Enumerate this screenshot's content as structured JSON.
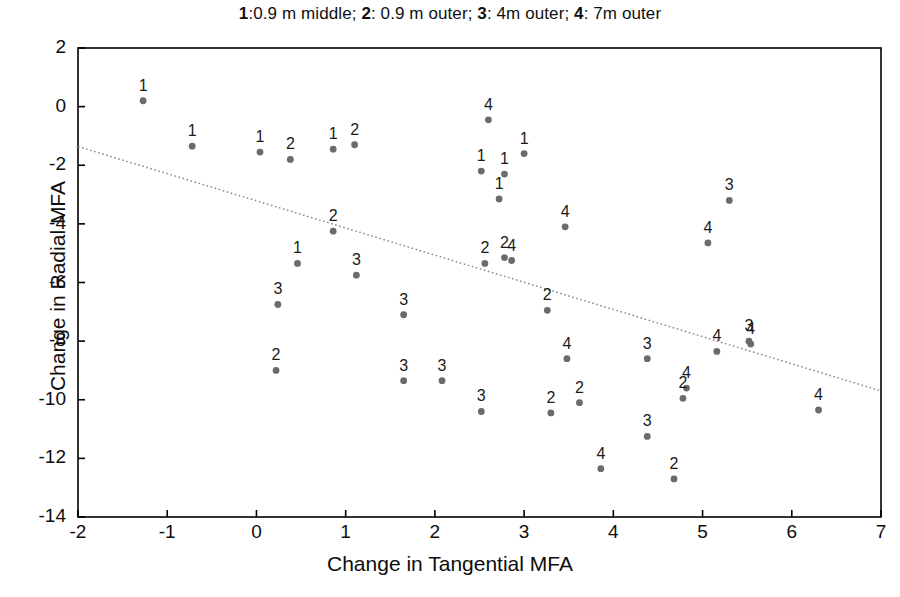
{
  "chart_data": {
    "type": "scatter",
    "title": "1:0.9 m middle; 2: 0.9 m outer; 3: 4m outer; 4: 7m outer",
    "title_parts": [
      {
        "key": "1",
        "text": ":0.9 m middle; "
      },
      {
        "key": "2",
        "text": ": 0.9 m outer; "
      },
      {
        "key": "3",
        "text": ": 4m outer; "
      },
      {
        "key": "4",
        "text": ": 7m outer"
      }
    ],
    "xlabel": "Change in Tangential MFA",
    "ylabel": "Change in Radial MFA",
    "xlim": [
      -2,
      7
    ],
    "ylim": [
      -14,
      2
    ],
    "xticks": [
      -2,
      -1,
      0,
      1,
      2,
      3,
      4,
      5,
      6,
      7
    ],
    "yticks": [
      2,
      0,
      -2,
      -4,
      -6,
      -8,
      -10,
      -12,
      -14
    ],
    "grid": false,
    "legend": "none",
    "legend_note": "Point labels 1-4 encode the group; legend is embedded in the title.",
    "marker_color": "#6b6b6b",
    "label_color": "#1a1a1a",
    "axis_color": "#000000",
    "trendline": {
      "style": "dotted",
      "color": "#8a8a8a",
      "x0": -2,
      "y0": -1.36,
      "x1": 7,
      "y1": -9.7
    },
    "series": [
      {
        "name": "1",
        "group_label": "0.9 m middle",
        "points": [
          {
            "x": -1.27,
            "y": 0.2
          },
          {
            "x": -0.72,
            "y": -1.35
          },
          {
            "x": 0.04,
            "y": -1.55
          },
          {
            "x": 0.46,
            "y": -5.35
          },
          {
            "x": 0.86,
            "y": -1.45
          },
          {
            "x": 2.52,
            "y": -2.2
          },
          {
            "x": 2.78,
            "y": -2.3
          },
          {
            "x": 2.72,
            "y": -3.15
          },
          {
            "x": 3.0,
            "y": -1.6
          }
        ]
      },
      {
        "name": "2",
        "group_label": "0.9 m outer",
        "points": [
          {
            "x": 0.22,
            "y": -9.0
          },
          {
            "x": 0.38,
            "y": -1.8
          },
          {
            "x": 1.1,
            "y": -1.3
          },
          {
            "x": 0.86,
            "y": -4.25
          },
          {
            "x": 2.56,
            "y": -5.35
          },
          {
            "x": 2.78,
            "y": -5.15
          },
          {
            "x": 3.26,
            "y": -6.95
          },
          {
            "x": 3.3,
            "y": -10.45
          },
          {
            "x": 3.62,
            "y": -10.1
          },
          {
            "x": 4.68,
            "y": -12.7
          },
          {
            "x": 4.78,
            "y": -9.95
          }
        ]
      },
      {
        "name": "3",
        "group_label": "4m outer",
        "points": [
          {
            "x": 0.24,
            "y": -6.75
          },
          {
            "x": 1.12,
            "y": -5.75
          },
          {
            "x": 1.65,
            "y": -7.1
          },
          {
            "x": 1.65,
            "y": -9.35
          },
          {
            "x": 2.08,
            "y": -9.35
          },
          {
            "x": 2.52,
            "y": -10.4
          },
          {
            "x": 4.38,
            "y": -11.25
          },
          {
            "x": 4.38,
            "y": -8.6
          },
          {
            "x": 5.3,
            "y": -3.2
          },
          {
            "x": 5.52,
            "y": -8.0
          }
        ]
      },
      {
        "name": "4",
        "group_label": "7m outer",
        "points": [
          {
            "x": 2.6,
            "y": -0.45
          },
          {
            "x": 2.86,
            "y": -5.25
          },
          {
            "x": 3.46,
            "y": -4.1
          },
          {
            "x": 3.48,
            "y": -8.6
          },
          {
            "x": 3.86,
            "y": -12.35
          },
          {
            "x": 4.82,
            "y": -9.6
          },
          {
            "x": 5.06,
            "y": -4.65
          },
          {
            "x": 5.16,
            "y": -8.35
          },
          {
            "x": 5.54,
            "y": -8.1
          },
          {
            "x": 6.3,
            "y": -10.35
          }
        ]
      }
    ]
  }
}
